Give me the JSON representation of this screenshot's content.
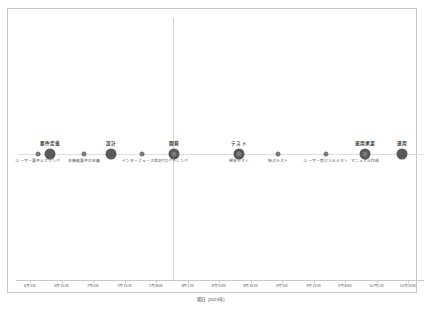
{
  "chart_data": {
    "type": "scatter",
    "title": "",
    "subtitle": "",
    "xlabel": "期日（2023年）",
    "ylabel": "",
    "grid": true,
    "legend_position": "none",
    "orientation": "horizontal-timeline",
    "baseline_y_px": 145,
    "vertical_gridline_x_px": 165,
    "xlim": [
      "6月1日",
      "10月15日"
    ],
    "x_tick_labels": [
      "6月1日",
      "6月15日",
      "7月1日",
      "7月15日",
      "7月30日",
      "8月1日",
      "8月15日",
      "8月31日",
      "9月1日",
      "9月15日",
      "9月30日",
      "10月1日",
      "10月15日"
    ],
    "series": [
      {
        "name": "主要フェーズ",
        "marker": "large-dot",
        "color": "#595959",
        "label_position": "above",
        "points": [
          {
            "label": "要件定義",
            "x": "6月15日",
            "x_px": 42
          },
          {
            "label": "設計",
            "x": "7月10日",
            "x_px": 103
          },
          {
            "label": "開発",
            "x": "8月1日",
            "x_px": 166
          },
          {
            "label": "テスト",
            "x": "8月25日",
            "x_px": 231
          },
          {
            "label": "運用承認",
            "x": "9月28日",
            "x_px": 357
          },
          {
            "label": "運用",
            "x": "10月10日",
            "x_px": 394
          }
        ]
      },
      {
        "name": "サブタスク",
        "marker": "small-dot",
        "color": "#7a7a7a",
        "label_position": "below",
        "points": [
          {
            "label": "ユーザー要件ヒアリング",
            "x": "6月8日",
            "x_px": 30
          },
          {
            "label": "非機能要件の定義",
            "x": "6月26日",
            "x_px": 76
          },
          {
            "label": "インターフェース設計",
            "x": "7月18日",
            "x_px": 134
          },
          {
            "label": "プログラミング",
            "x": "8月1日",
            "x_px": 166
          },
          {
            "label": "単体テスト",
            "x": "8月25日",
            "x_px": 231
          },
          {
            "label": "結合テスト",
            "x": "9月5日",
            "x_px": 270
          },
          {
            "label": "ユーザー受け入れテスト",
            "x": "9月20日",
            "x_px": 318
          },
          {
            "label": "マニュアル作成",
            "x": "9月28日",
            "x_px": 357
          }
        ]
      }
    ],
    "colors": {
      "major_marker": "#595959",
      "minor_marker": "#7a7a7a",
      "baseline": "#dddddd",
      "gridline": "#d5d5d5",
      "frame": "#c9c9c9",
      "background": "#ffffff",
      "label_text": "#3a3a3a"
    }
  }
}
